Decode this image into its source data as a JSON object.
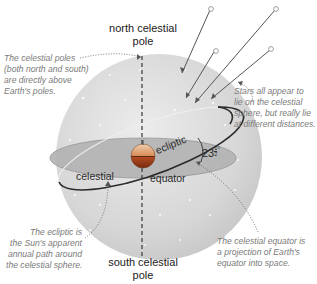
{
  "diagram": {
    "type": "celestial-sphere",
    "labels": {
      "north_pole_line1": "north celestial",
      "north_pole_line2": "pole",
      "south_pole_line1": "south celestial",
      "south_pole_line2": "pole",
      "equator_left": "celestial",
      "equator_right": "equator",
      "ecliptic": "ecliptic",
      "tilt_angle": "23",
      "tilt_fraction_num": "1",
      "tilt_fraction_den": "2",
      "tilt_degree": "°"
    },
    "annotations": {
      "poles": [
        "The celestial poles",
        "(both north and south)",
        "are directly above",
        "Earth's poles."
      ],
      "stars": [
        "Stars all appear to",
        "lie on the celestial",
        "sphere, but really lie",
        "at different distances."
      ],
      "ecliptic": [
        "The ecliptic is",
        "the Sun's apparent",
        "annual path around",
        "the celestial sphere."
      ],
      "equator": [
        "The celestial equator is",
        "a projection of Earth's",
        "equator into space."
      ]
    },
    "colors": {
      "sphere": "#d8d8d8",
      "equator_plane": "#b8b8b8",
      "ecliptic_line": "#2a2a2a",
      "earth_top": "#e0a070",
      "earth_bottom": "#c05a2a",
      "note_text": "#7a7a7a"
    }
  }
}
